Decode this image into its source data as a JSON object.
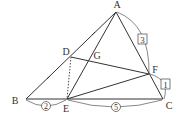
{
  "diagram": {
    "type": "geometry-triangle",
    "colors": {
      "line": "#333333",
      "background": "#ffffff"
    },
    "points": {
      "A": {
        "label": "A",
        "x": 116,
        "y": 12,
        "lx": 117,
        "ly": 8
      },
      "B": {
        "label": "B",
        "x": 26,
        "y": 99,
        "lx": 15,
        "ly": 104
      },
      "C": {
        "label": "C",
        "x": 163,
        "y": 99,
        "lx": 169,
        "ly": 109
      },
      "D": {
        "label": "D",
        "x": 71,
        "y": 57,
        "lx": 66,
        "ly": 55
      },
      "E": {
        "label": "E",
        "x": 67,
        "y": 99,
        "lx": 66,
        "ly": 112
      },
      "F": {
        "label": "F",
        "x": 149,
        "y": 74,
        "lx": 155,
        "ly": 73
      },
      "G": {
        "label": "G",
        "x": 90,
        "y": 60,
        "lx": 97,
        "ly": 59
      }
    },
    "segments": [
      "AB",
      "BC",
      "CA",
      "AE",
      "DF",
      "EF"
    ],
    "dashed_segments": [
      "DE"
    ],
    "equal_marks": {
      "segment_parts": [
        "AD",
        "DB"
      ],
      "symbol": "tick"
    },
    "ratio_labels": {
      "AF": {
        "value": "3",
        "style": "boxed"
      },
      "FC": {
        "value": "1",
        "style": "boxed"
      },
      "BE": {
        "value": "2",
        "style": "circled"
      },
      "EC": {
        "value": "5",
        "style": "circled"
      }
    }
  }
}
